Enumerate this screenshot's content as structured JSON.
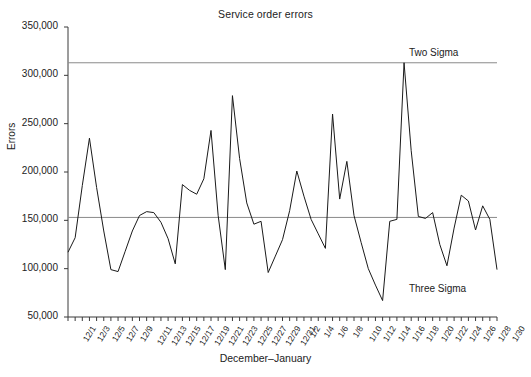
{
  "chart_data": {
    "type": "line",
    "title": "Service order errors",
    "xlabel": "December–January",
    "ylabel": "Errors",
    "ylim": [
      50000,
      350000
    ],
    "ytick_values": [
      50000,
      100000,
      150000,
      200000,
      250000,
      300000,
      350000
    ],
    "ytick_labels": [
      "50,000",
      "100,000",
      "150,000",
      "200,000",
      "250,000",
      "300,000",
      "350,000"
    ],
    "grid": false,
    "legend": "none",
    "x": [
      "12/1",
      "12/2",
      "12/3",
      "12/4",
      "12/5",
      "12/6",
      "12/7",
      "12/8",
      "12/9",
      "12/10",
      "12/11",
      "12/12",
      "12/13",
      "12/14",
      "12/15",
      "12/16",
      "12/17",
      "12/18",
      "12/19",
      "12/20",
      "12/21",
      "12/22",
      "12/23",
      "12/24",
      "12/25",
      "12/26",
      "12/27",
      "12/28",
      "12/29",
      "12/30",
      "12/31",
      "1/1",
      "1/2",
      "1/3",
      "1/4",
      "1/5",
      "1/6",
      "1/7",
      "1/8",
      "1/9",
      "1/10",
      "1/11",
      "1/12",
      "1/13",
      "1/14",
      "1/15",
      "1/16",
      "1/17",
      "1/18",
      "1/19",
      "1/20",
      "1/21",
      "1/22",
      "1/23",
      "1/24",
      "1/25",
      "1/26",
      "1/27",
      "1/28",
      "1/29",
      "1/30"
    ],
    "xtick_labels_shown": [
      "12/1",
      "12/3",
      "12/5",
      "12/7",
      "12/9",
      "12/11",
      "12/13",
      "12/15",
      "12/17",
      "12/19",
      "12/21",
      "12/23",
      "12/25",
      "12/27",
      "12/29",
      "12/31",
      "1/2",
      "1/4",
      "1/6",
      "1/8",
      "1/10",
      "1/12",
      "1/14",
      "1/16",
      "1/18",
      "1/20",
      "1/22",
      "1/24",
      "1/26",
      "1/28",
      "1/30"
    ],
    "series": [
      {
        "name": "Errors",
        "color": "#1a1a1a",
        "values": [
          117000,
          132000,
          186000,
          235000,
          184000,
          139000,
          99000,
          97000,
          118000,
          139000,
          155000,
          159000,
          158000,
          148000,
          131000,
          105000,
          187000,
          181000,
          177000,
          193000,
          243000,
          155000,
          99000,
          279000,
          214000,
          168000,
          146000,
          149000,
          96000,
          113000,
          130000,
          160000,
          201000,
          175000,
          151000,
          136000,
          121000,
          260000,
          172000,
          211000,
          155000,
          127000,
          100000,
          83000,
          67000,
          149000,
          151000,
          313000,
          222000,
          154000,
          152000,
          158000,
          125000,
          103000,
          142000,
          176000,
          170000,
          140000,
          165000,
          151000,
          99000
        ]
      }
    ],
    "reference_lines": [
      {
        "label": "Two Sigma",
        "value": 313000,
        "color": "#8a8a8a"
      },
      {
        "label": "Three Sigma",
        "value": 153000,
        "color": "#8a8a8a"
      }
    ],
    "annotations": [
      {
        "text": "Two Sigma",
        "x_frac": 0.86,
        "y_value": 322000
      },
      {
        "text": "Three Sigma",
        "x_frac": 0.86,
        "y_value": 78000
      }
    ]
  }
}
